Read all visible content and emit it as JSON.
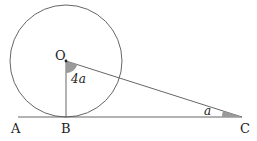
{
  "diagram": {
    "type": "geometry",
    "points": {
      "O": {
        "label": "O"
      },
      "A": {
        "label": "A"
      },
      "B": {
        "label": "B"
      },
      "C": {
        "label": "C"
      }
    },
    "angles": {
      "at_O": {
        "label": "4a"
      },
      "at_C": {
        "label": "a"
      }
    },
    "colors": {
      "stroke": "#555555",
      "shade": "#9a9a9a"
    }
  }
}
